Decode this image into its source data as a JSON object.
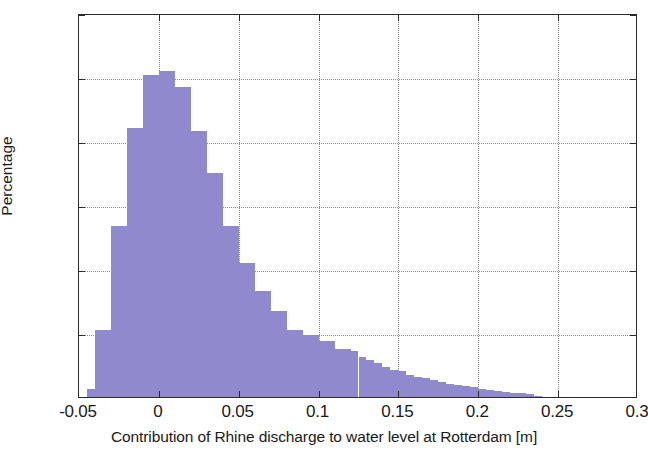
{
  "chart_data": {
    "type": "bar",
    "title": "",
    "subtitle": "",
    "xlabel": "Contribution of Rhine discharge to water level at Rotterdam [m]",
    "ylabel": "Percentage",
    "xlim": [
      -0.05,
      0.3
    ],
    "ylim": [
      0,
      12
    ],
    "xticks": [
      -0.05,
      0,
      0.05,
      0.1,
      0.15,
      0.2,
      0.25,
      0.3
    ],
    "xtick_labels": [
      "-0.05",
      "0",
      "0.05",
      "0.1",
      "0.15",
      "0.2",
      "0.25",
      "0.3"
    ],
    "yticks": [
      0,
      2,
      4,
      6,
      8,
      10,
      12
    ],
    "ytick_labels": [
      "0",
      "2",
      "4",
      "6",
      "8",
      "10",
      "12"
    ],
    "grid": true,
    "legend": null,
    "bar_color": "#9189ce",
    "axis_color": "#2b2b2b",
    "grid_color": "#8c8c8c",
    "bin_width": 0.005,
    "bins_left_edges": [
      -0.045,
      -0.04,
      -0.035,
      -0.03,
      -0.025,
      -0.02,
      -0.015,
      -0.01,
      -0.005,
      0.0,
      0.005,
      0.01,
      0.015,
      0.02,
      0.025,
      0.03,
      0.035,
      0.04,
      0.045,
      0.05,
      0.055,
      0.06,
      0.065,
      0.07,
      0.075,
      0.08,
      0.085,
      0.09,
      0.095,
      0.1,
      0.105,
      0.11,
      0.115,
      0.12,
      0.125,
      0.13,
      0.135,
      0.14,
      0.145,
      0.15,
      0.155,
      0.16,
      0.165,
      0.17,
      0.175,
      0.18,
      0.185,
      0.19,
      0.195,
      0.2,
      0.205,
      0.21,
      0.215,
      0.22,
      0.225,
      0.23,
      0.235
    ],
    "values": [
      0.25,
      2.1,
      2.1,
      5.35,
      5.35,
      8.4,
      8.4,
      10.05,
      10.05,
      10.2,
      10.2,
      9.7,
      9.7,
      8.3,
      8.3,
      7.0,
      7.0,
      5.35,
      5.35,
      4.2,
      4.2,
      3.3,
      3.3,
      2.7,
      2.7,
      2.1,
      2.1,
      1.95,
      1.95,
      1.75,
      1.75,
      1.5,
      1.5,
      1.45,
      1.25,
      1.15,
      1.05,
      0.95,
      0.85,
      0.8,
      0.7,
      0.62,
      0.58,
      0.52,
      0.48,
      0.42,
      0.38,
      0.33,
      0.3,
      0.26,
      0.22,
      0.19,
      0.16,
      0.13,
      0.11,
      0.08,
      0.04
    ],
    "peak_value": 10.2,
    "peak_location": 0.0
  }
}
